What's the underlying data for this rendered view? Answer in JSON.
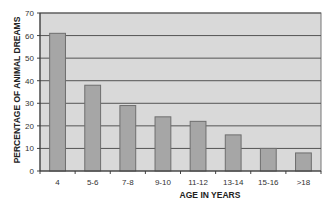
{
  "chart_data": {
    "type": "bar",
    "title": "",
    "xlabel": "AGE IN YEARS",
    "ylabel": "PERCENTAGE OF ANIMAL DREAMS",
    "categories": [
      "4",
      "5-6",
      "7-8",
      "9-10",
      "11-12",
      "13-14",
      "15-16",
      ">18"
    ],
    "values": [
      61,
      38,
      29,
      24,
      22,
      16,
      10,
      8
    ],
    "ylim": [
      0,
      70
    ],
    "yticks": [
      0,
      10,
      20,
      30,
      40,
      50,
      60,
      70
    ],
    "grid": true,
    "legend": null,
    "colors": {
      "bar": "#a6a6a6",
      "bar_border": "#6e6e6e",
      "plot_bg": "#d9d9d9",
      "grid": "#555555"
    }
  }
}
